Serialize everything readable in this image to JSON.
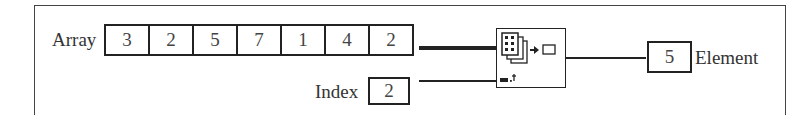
{
  "diagram": {
    "array_control": {
      "label": "Array",
      "values": [
        "3",
        "2",
        "5",
        "7",
        "1",
        "4",
        "2"
      ]
    },
    "index_control": {
      "label": "Index",
      "value": "2"
    },
    "function_node": {
      "name": "Index Array",
      "icon": "index-array-icon"
    },
    "element_indicator": {
      "label": "Element",
      "value": "5"
    }
  }
}
